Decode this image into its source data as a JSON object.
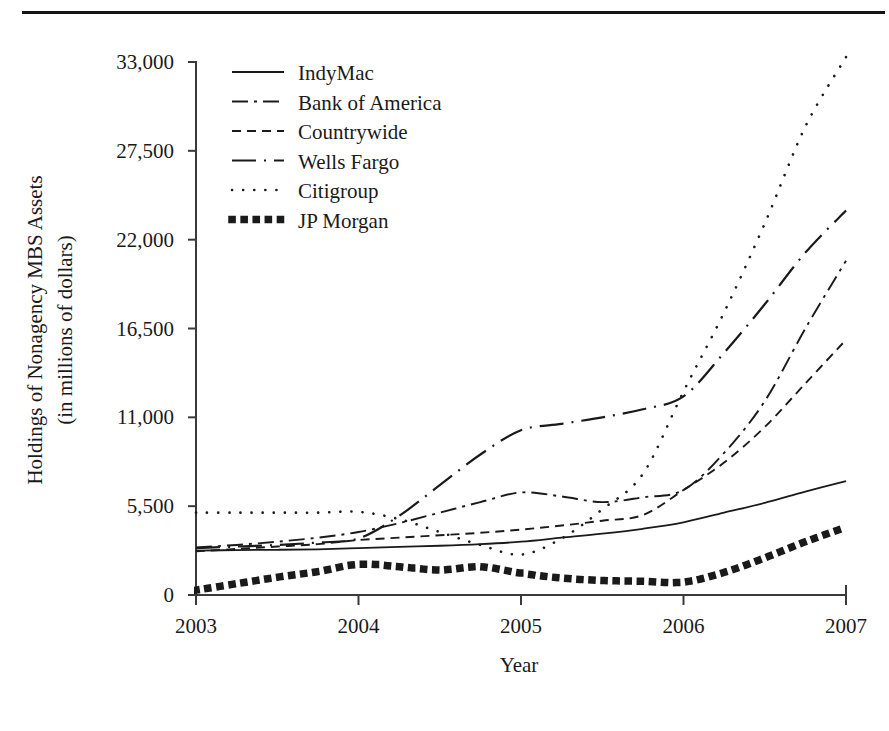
{
  "figure": {
    "has_top_rule": true,
    "background_color": "#ffffff",
    "ink_color": "#1a1a1a"
  },
  "chart_data": {
    "type": "line",
    "title": "",
    "xlabel": "Year",
    "ylabel": "Holdings of Nonagency MBS Assets",
    "ylabel_line2": "(in millions of dollars)",
    "xlim": [
      2003,
      2007
    ],
    "ylim": [
      0,
      33000
    ],
    "xticks": [
      2003,
      2004,
      2005,
      2006,
      2007
    ],
    "xtick_labels": [
      "2003",
      "2004",
      "2005",
      "2006",
      "2007"
    ],
    "yticks": [
      0,
      5500,
      11000,
      16500,
      22000,
      27500,
      33000
    ],
    "ytick_labels": [
      "0",
      "5,500",
      "11,000",
      "16,500",
      "22,000",
      "27,500",
      "33,000"
    ],
    "grid": false,
    "legend_position": "upper-left-inside",
    "x": [
      2003,
      2003.25,
      2003.5,
      2003.75,
      2004,
      2004.25,
      2004.5,
      2004.75,
      2005,
      2005.25,
      2005.5,
      2005.75,
      2006,
      2006.25,
      2006.5,
      2006.75,
      2007
    ],
    "series": [
      {
        "name": "IndyMac",
        "style": "solid",
        "values": [
          2750,
          2780,
          2800,
          2830,
          2900,
          2980,
          3050,
          3150,
          3300,
          3550,
          3800,
          4100,
          4500,
          5100,
          5700,
          6400,
          7050
        ]
      },
      {
        "name": "Bank of America",
        "style": "dash-dot",
        "values": [
          2950,
          3100,
          3300,
          3550,
          3900,
          4450,
          5100,
          5750,
          6350,
          6100,
          5750,
          6050,
          6500,
          8800,
          12000,
          16500,
          20700
        ]
      },
      {
        "name": "Countrywide",
        "style": "dashed",
        "values": [
          2700,
          2850,
          3000,
          3150,
          3400,
          3550,
          3700,
          3850,
          4050,
          4300,
          4600,
          4950,
          6500,
          8200,
          10400,
          13100,
          15800
        ]
      },
      {
        "name": "Wells Fargo",
        "style": "long-dash-dot",
        "values": [
          2900,
          3000,
          3100,
          3250,
          3500,
          4900,
          6800,
          8700,
          10200,
          10600,
          11000,
          11500,
          12300,
          15000,
          18000,
          21200,
          23800
        ]
      },
      {
        "name": "Citigroup",
        "style": "dotted",
        "values": [
          5100,
          5100,
          5100,
          5100,
          5150,
          4700,
          3900,
          3100,
          2500,
          3500,
          5300,
          7500,
          12600,
          17500,
          23000,
          29000,
          33300
        ]
      },
      {
        "name": "JP Morgan",
        "style": "square-dots",
        "values": [
          300,
          700,
          1100,
          1450,
          1900,
          1750,
          1550,
          1750,
          1350,
          1050,
          900,
          850,
          800,
          1400,
          2300,
          3300,
          4200
        ]
      }
    ]
  },
  "legend": {
    "entries": [
      {
        "label": "IndyMac",
        "style": "solid"
      },
      {
        "label": "Bank of America",
        "style": "dash-dot"
      },
      {
        "label": "Countrywide",
        "style": "dashed"
      },
      {
        "label": "Wells Fargo",
        "style": "long-dash-dot"
      },
      {
        "label": "Citigroup",
        "style": "dotted"
      },
      {
        "label": "JP Morgan",
        "style": "square-dots"
      }
    ]
  }
}
